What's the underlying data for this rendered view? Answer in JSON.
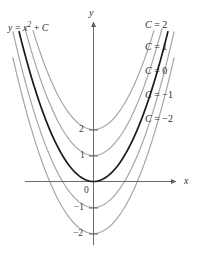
{
  "figure": {
    "title_label": "y = x² + C",
    "equation": {
      "lhs": "y",
      "equals": " = ",
      "base": "x",
      "exponent": "2",
      "plus": " + ",
      "constant": "C"
    },
    "axes": {
      "x_name": "x",
      "y_name": "y",
      "origin_label": "0"
    },
    "y_ticks": [
      {
        "value": 2,
        "label": "2"
      },
      {
        "value": 1,
        "label": "1"
      },
      {
        "value": -1,
        "label": "−1"
      },
      {
        "value": -2,
        "label": "−2"
      }
    ],
    "curve_labels": [
      {
        "text": "C = 2",
        "c": "C",
        "eq": " = ",
        "val": "2"
      },
      {
        "text": "C = 1",
        "c": "C",
        "eq": " = ",
        "val": "1"
      },
      {
        "text": "C = 0",
        "c": "C",
        "eq": " = ",
        "val": "0"
      },
      {
        "text": "C = −1",
        "c": "C",
        "eq": " = ",
        "val": "−1"
      },
      {
        "text": "C = −2",
        "c": "C",
        "eq": " = ",
        "val": "−2"
      }
    ],
    "colors": {
      "background": "#ffffff",
      "axis": "#6b6b6b",
      "curve_gray": "#a6a6a6",
      "curve_highlight": "#1a1a1a",
      "text": "#2b2b2b"
    }
  },
  "chart_data": {
    "type": "line",
    "xlabel": "x",
    "ylabel": "y",
    "xlim": [
      -2.6,
      2.6
    ],
    "ylim": [
      -2.6,
      6.4
    ],
    "grid": false,
    "legend": "inline-right-of-curves",
    "x": [
      -2.6,
      -2.2,
      -1.8,
      -1.4,
      -1.0,
      -0.6,
      -0.2,
      0.0,
      0.2,
      0.6,
      1.0,
      1.4,
      1.8,
      2.2,
      2.6
    ],
    "series": [
      {
        "name": "C = 2",
        "C": 2,
        "color": "#a6a6a6",
        "highlighted": false,
        "vertex": [
          0,
          2
        ],
        "values": [
          8.76,
          6.84,
          5.24,
          3.96,
          3.0,
          2.36,
          2.04,
          2.0,
          2.04,
          2.36,
          3.0,
          3.96,
          5.24,
          6.84,
          8.76
        ]
      },
      {
        "name": "C = 1",
        "C": 1,
        "color": "#a6a6a6",
        "highlighted": false,
        "vertex": [
          0,
          1
        ],
        "values": [
          7.76,
          5.84,
          4.24,
          2.96,
          2.0,
          1.36,
          1.04,
          1.0,
          1.04,
          1.36,
          2.0,
          2.96,
          4.24,
          5.84,
          7.76
        ]
      },
      {
        "name": "C = 0",
        "C": 0,
        "color": "#1a1a1a",
        "highlighted": true,
        "vertex": [
          0,
          0
        ],
        "values": [
          6.76,
          4.84,
          3.24,
          1.96,
          1.0,
          0.36,
          0.04,
          0.0,
          0.04,
          0.36,
          1.0,
          1.96,
          3.24,
          4.84,
          6.76
        ]
      },
      {
        "name": "C = −1",
        "C": -1,
        "color": "#a6a6a6",
        "highlighted": false,
        "vertex": [
          0,
          -1
        ],
        "values": [
          5.76,
          3.84,
          2.24,
          0.96,
          0.0,
          -0.64,
          -0.96,
          -1.0,
          -0.96,
          -0.64,
          0.0,
          0.96,
          2.24,
          3.84,
          5.76
        ]
      },
      {
        "name": "C = −2",
        "C": -2,
        "color": "#a6a6a6",
        "highlighted": false,
        "vertex": [
          0,
          -2
        ],
        "values": [
          4.76,
          2.84,
          1.24,
          -0.04,
          -1.0,
          -1.64,
          -1.96,
          -2.0,
          -1.96,
          -1.64,
          -1.0,
          -0.04,
          1.24,
          2.84,
          4.76
        ]
      }
    ],
    "annotations": [
      {
        "text": "y = x² + C",
        "position": "top-left"
      }
    ],
    "y_tick_values": [
      2,
      1,
      0,
      -1,
      -2
    ]
  }
}
